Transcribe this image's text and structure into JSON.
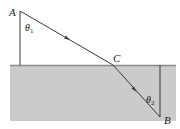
{
  "diagram": {
    "type": "refraction-ray",
    "points": {
      "A": {
        "label": "A"
      },
      "B": {
        "label": "B"
      },
      "C": {
        "label": "C"
      }
    },
    "angles": {
      "theta1": {
        "symbol": "θ",
        "sub": "1"
      },
      "theta2": {
        "symbol": "θ",
        "sub": "2"
      }
    },
    "colors": {
      "medium": "#c9c9c9",
      "surface": "#8a8a8a",
      "ray": "#3a3a3a"
    }
  }
}
